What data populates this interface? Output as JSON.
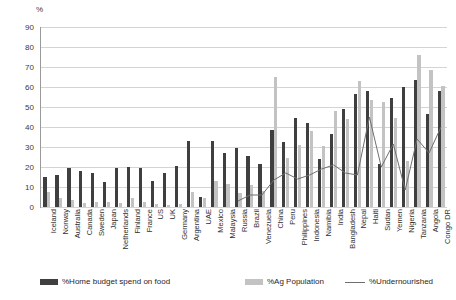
{
  "chart_data": {
    "type": "bar",
    "title": "",
    "subtitle": "",
    "xlabel": "",
    "ylabel": "%",
    "ylim": [
      0,
      90
    ],
    "ytick_step": 10,
    "yticks": [
      0,
      10,
      20,
      30,
      40,
      50,
      60,
      70,
      80,
      90
    ],
    "grid": true,
    "legend_position": "bottom",
    "categories": [
      "Iceland",
      "Norway",
      "Australia",
      "Canada",
      "Sweden",
      "Japan",
      "Netherlands",
      "Finland",
      "France",
      "US",
      "UK",
      "Germany",
      "Argentina",
      "UAE",
      "Mexico",
      "Malaysia",
      "Russia",
      "Brazil",
      "Venezuela",
      "China",
      "Peru",
      "Philippines",
      "Indonesia",
      "Namibia",
      "India",
      "Bangladesh",
      "Nepal",
      "Haiti",
      "Sudan",
      "Yemen",
      "Nigeria",
      "Tanzania",
      "Angola",
      "Congo DR"
    ],
    "series": [
      {
        "name": "%Home budget spend on food",
        "color": "#3f3f3f",
        "type": "bar",
        "values": [
          15,
          16,
          19.5,
          18,
          17,
          12.5,
          19.5,
          20,
          19.5,
          13,
          17,
          20.5,
          33,
          5,
          33,
          27,
          29.5,
          25.5,
          21.5,
          38.5,
          32.5,
          44.5,
          42,
          24,
          36.5,
          49,
          56.5,
          58,
          21.5,
          54.5,
          60,
          63.5,
          46.5,
          58
        ]
      },
      {
        "name": "%Ag Population",
        "color": "#c3c3c3",
        "type": "bar",
        "values": [
          7.5,
          4.5,
          3.5,
          2,
          2.5,
          2.5,
          2,
          4.5,
          2.5,
          1.5,
          1,
          1.5,
          7.5,
          4.5,
          13,
          11.5,
          7,
          11,
          8,
          65,
          24.5,
          31,
          38,
          30.5,
          48,
          44,
          63,
          53.5,
          52.5,
          44.5,
          23,
          76,
          68.5,
          60.5
        ]
      },
      {
        "name": "%Undernourished",
        "color": "#6f6f6f",
        "type": "line",
        "values": [
          null,
          null,
          null,
          null,
          null,
          null,
          null,
          null,
          null,
          null,
          null,
          null,
          null,
          null,
          null,
          null,
          3,
          6,
          6,
          13.5,
          17,
          14,
          16,
          19,
          21,
          17,
          16,
          45,
          20,
          31.5,
          8.5,
          34,
          27,
          40
        ]
      }
    ]
  },
  "legend": {
    "items": [
      {
        "label": "%Home budget spend on food",
        "swatch": "dark-bar-swatch"
      },
      {
        "label": "%Ag Population",
        "swatch": "light-bar-swatch"
      },
      {
        "label": "%Undernourished",
        "swatch": "line-swatch"
      }
    ]
  }
}
